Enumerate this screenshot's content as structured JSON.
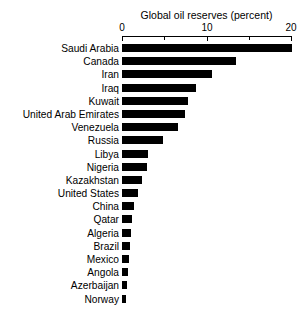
{
  "chart_data": {
    "type": "bar",
    "orientation": "horizontal",
    "title": "Global oil reserves (percent)",
    "xlabel": "",
    "ylabel": "",
    "xlim": [
      0,
      20
    ],
    "xticks": [
      0,
      5,
      10,
      15,
      20
    ],
    "xtick_labels": [
      "0",
      "",
      "10",
      "",
      "20"
    ],
    "grid": false,
    "legend": false,
    "bar_color": "#000000",
    "categories": [
      "Saudi Arabia",
      "Canada",
      "Iran",
      "Iraq",
      "Kuwait",
      "United Arab Emirates",
      "Venezuela",
      "Russia",
      "Libya",
      "Nigeria",
      "Kazakhstan",
      "United States",
      "China",
      "Qatar",
      "Algeria",
      "Brazil",
      "Mexico",
      "Angola",
      "Azerbaijan",
      "Norway"
    ],
    "values": [
      20.1,
      13.5,
      10.6,
      8.7,
      7.8,
      7.5,
      6.6,
      4.8,
      3.1,
      2.9,
      2.4,
      1.9,
      1.4,
      1.2,
      1.0,
      0.9,
      0.8,
      0.7,
      0.6,
      0.5
    ]
  }
}
